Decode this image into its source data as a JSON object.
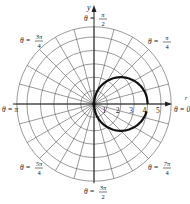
{
  "chart_data": {
    "type": "polar-line",
    "title": "",
    "equation_shape": "circle r = 4cos(theta)",
    "radial_ticks": [
      "1",
      "2",
      "3",
      "4",
      "5"
    ],
    "radial_range": [
      0,
      6
    ],
    "angular_grid_step_deg": 15,
    "axis_labels": {
      "x": "r",
      "y": "y"
    },
    "angle_labels": [
      {
        "id": "a0",
        "text": "θ = 0"
      },
      {
        "id": "a90",
        "prefix": "θ =",
        "num": "π",
        "den": "2",
        "text": "θ = π/2"
      },
      {
        "id": "a45",
        "prefix": "θ =",
        "num": "π",
        "den": "4",
        "text": "θ = π/4"
      },
      {
        "id": "a135",
        "prefix": "θ =",
        "num": "3π",
        "den": "4",
        "text": "θ = 3π/4"
      },
      {
        "id": "a180",
        "text": "θ = π"
      },
      {
        "id": "a225",
        "prefix": "θ =",
        "num": "5π",
        "den": "4",
        "text": "θ = 5π/4"
      },
      {
        "id": "a270",
        "prefix": "θ =",
        "num": "3π",
        "den": "2",
        "text": "θ = 3π/2"
      },
      {
        "id": "a315",
        "prefix": "θ =",
        "num": "7π",
        "den": "4",
        "text": "θ = 7π/4"
      }
    ],
    "series": [
      {
        "name": "curve",
        "description": "Circle of diameter 4 passing through origin, centered at (2,0); drawn from θ=0 counterclockwise, ending just short of closing below the polar axis",
        "points_polar": [
          {
            "theta_deg": 0,
            "r": 4
          },
          {
            "theta_deg": 30,
            "r": 3.46
          },
          {
            "theta_deg": 60,
            "r": 2
          },
          {
            "theta_deg": 90,
            "r": 0
          },
          {
            "theta_deg": 120,
            "r": -2
          },
          {
            "theta_deg": 150,
            "r": -3.46
          },
          {
            "theta_deg": 170,
            "r": -3.94
          }
        ],
        "color": "#111111"
      }
    ],
    "grid": true
  },
  "colors": {
    "grid": "#555555",
    "curve": "#111111",
    "axis": "#333333"
  }
}
